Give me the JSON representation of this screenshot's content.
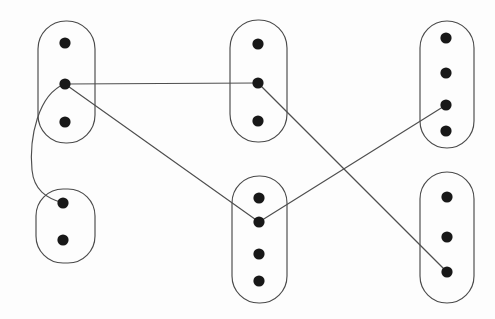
{
  "figure": {
    "kind": "clustered-graph-diagram",
    "canvas": {
      "width": 495,
      "height": 319
    },
    "background_color": "#fdfdfd",
    "outline_color": "#4a4a4a",
    "edge_color": "#4e4e4e",
    "vertex_color": "#181818",
    "vertex_radius": 5.6,
    "stroke_width": 1.15
  },
  "clusters": [
    {
      "id": "top-left",
      "vertex_count": 3,
      "box": {
        "x": 38,
        "y": 21,
        "width": 57,
        "height": 122
      },
      "corner_radius": 28
    },
    {
      "id": "bottom-left",
      "vertex_count": 2,
      "box": {
        "x": 36,
        "y": 189,
        "width": 59,
        "height": 74
      },
      "corner_radius": 27
    },
    {
      "id": "top-middle",
      "vertex_count": 3,
      "box": {
        "x": 230,
        "y": 20,
        "width": 57,
        "height": 122
      },
      "corner_radius": 28
    },
    {
      "id": "bottom-middle",
      "vertex_count": 4,
      "box": {
        "x": 232,
        "y": 176,
        "width": 55,
        "height": 127
      },
      "corner_radius": 27
    },
    {
      "id": "top-right",
      "vertex_count": 4,
      "box": {
        "x": 420,
        "y": 21,
        "width": 54,
        "height": 127
      },
      "corner_radius": 27
    },
    {
      "id": "bottom-right",
      "vertex_count": 3,
      "box": {
        "x": 420,
        "y": 172,
        "width": 54,
        "height": 131
      },
      "corner_radius": 27
    }
  ],
  "vertices": [
    {
      "id": "tl1",
      "cluster": "top-left",
      "cx": 65,
      "cy": 43
    },
    {
      "id": "tl2",
      "cluster": "top-left",
      "cx": 65,
      "cy": 84
    },
    {
      "id": "tl3",
      "cluster": "top-left",
      "cx": 65,
      "cy": 122
    },
    {
      "id": "bl1",
      "cluster": "bottom-left",
      "cx": 63,
      "cy": 203
    },
    {
      "id": "bl2",
      "cluster": "bottom-left",
      "cx": 63,
      "cy": 240
    },
    {
      "id": "tm1",
      "cluster": "top-middle",
      "cx": 258,
      "cy": 44
    },
    {
      "id": "tm2",
      "cluster": "top-middle",
      "cx": 258,
      "cy": 83
    },
    {
      "id": "tm3",
      "cluster": "top-middle",
      "cx": 258,
      "cy": 121
    },
    {
      "id": "bm1",
      "cluster": "bottom-middle",
      "cx": 259,
      "cy": 198
    },
    {
      "id": "bm2",
      "cluster": "bottom-middle",
      "cx": 259,
      "cy": 222
    },
    {
      "id": "bm3",
      "cluster": "bottom-middle",
      "cx": 259,
      "cy": 254
    },
    {
      "id": "bm4",
      "cluster": "bottom-middle",
      "cx": 259,
      "cy": 281
    },
    {
      "id": "tr1",
      "cluster": "top-right",
      "cx": 446,
      "cy": 38
    },
    {
      "id": "tr2",
      "cluster": "top-right",
      "cx": 446,
      "cy": 73
    },
    {
      "id": "tr3",
      "cluster": "top-right",
      "cx": 446,
      "cy": 105
    },
    {
      "id": "tr4",
      "cluster": "top-right",
      "cx": 446,
      "cy": 131
    },
    {
      "id": "br1",
      "cluster": "bottom-right",
      "cx": 447,
      "cy": 197
    },
    {
      "id": "br2",
      "cluster": "bottom-right",
      "cx": 447,
      "cy": 237
    },
    {
      "id": "br3",
      "cluster": "bottom-right",
      "cx": 447,
      "cy": 272
    }
  ],
  "edges": [
    {
      "id": "e1",
      "from": "tl2",
      "to": "tm2",
      "shape": "straight",
      "path": "M 65 84 L 258 83"
    },
    {
      "id": "e2",
      "from": "tl2",
      "to": "bm2",
      "shape": "straight",
      "path": "M 65 84 L 259 222"
    },
    {
      "id": "e3",
      "from": "tl2",
      "to": "bl1",
      "shape": "curved",
      "path": "M 65 84 C 38 94 29 138 32 170 C 34 190 46 198 63 203"
    },
    {
      "id": "e4",
      "from": "tm2",
      "to": "br3",
      "shape": "straight",
      "path": "M 258 83 L 447 272"
    },
    {
      "id": "e5",
      "from": "bm2",
      "to": "tr3",
      "shape": "straight",
      "path": "M 259 222 L 446 105"
    }
  ]
}
